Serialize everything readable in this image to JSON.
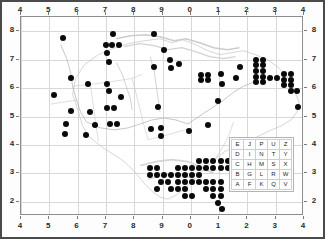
{
  "figure": {
    "type": "distribution-map",
    "background_color": "#ffffff",
    "frame_color": "#4a4a4a",
    "dot_color": "#0a0a0a",
    "gridline_color": "#d8d8d8",
    "coastline_color": "#b9b9b9"
  },
  "axes": {
    "top_labels": [
      "4",
      "5",
      "6",
      "7",
      "8",
      "9",
      "0",
      "1",
      "2",
      "3",
      "4"
    ],
    "bottom_labels": [
      "4",
      "5",
      "6",
      "7",
      "8",
      "9",
      "0",
      "1",
      "2",
      "3",
      "4"
    ],
    "left_labels": [
      "8",
      "7",
      "6",
      "5",
      "4",
      "3",
      "2"
    ],
    "right_labels": [
      "8",
      "7",
      "6",
      "5",
      "4",
      "3",
      "2"
    ]
  },
  "grid_key": {
    "rows": [
      [
        "E",
        "J",
        "P",
        "U",
        "Z"
      ],
      [
        "D",
        "I",
        "N",
        "T",
        "Y"
      ],
      [
        "C",
        "H",
        "M",
        "S",
        "X"
      ],
      [
        "B",
        "G",
        "L",
        "R",
        "W"
      ],
      [
        "A",
        "F",
        "K",
        "Q",
        "V"
      ]
    ]
  },
  "chart_data": {
    "type": "scatter",
    "title": "",
    "xlabel": "",
    "ylabel": "",
    "xlim": [
      4,
      14
    ],
    "ylim": [
      1.5,
      8.5
    ],
    "grid": true,
    "legend": "none",
    "x_tick_labels": [
      "4",
      "5",
      "6",
      "7",
      "8",
      "9",
      "0",
      "1",
      "2",
      "3",
      "4"
    ],
    "y_tick_labels": [
      "8",
      "7",
      "6",
      "5",
      "4",
      "3",
      "2"
    ],
    "marker": "filled-circle",
    "marker_size_px": 6,
    "point_count": 152,
    "points": [
      [
        5.5,
        7.75
      ],
      [
        7.25,
        7.9
      ],
      [
        8.7,
        7.9
      ],
      [
        7.0,
        7.5
      ],
      [
        7.2,
        7.5
      ],
      [
        7.45,
        7.5
      ],
      [
        7.05,
        7.25
      ],
      [
        9.05,
        7.35
      ],
      [
        9.25,
        7.0
      ],
      [
        9.6,
        6.85
      ],
      [
        10.35,
        6.45
      ],
      [
        10.6,
        6.45
      ],
      [
        10.35,
        6.3
      ],
      [
        10.6,
        6.3
      ],
      [
        11.05,
        6.5
      ],
      [
        11.75,
        6.75
      ],
      [
        12.3,
        7.0
      ],
      [
        12.55,
        7.0
      ],
      [
        12.3,
        6.8
      ],
      [
        12.55,
        6.8
      ],
      [
        12.3,
        6.6
      ],
      [
        12.55,
        6.6
      ],
      [
        12.3,
        6.4
      ],
      [
        12.55,
        6.4
      ],
      [
        12.3,
        6.2
      ],
      [
        12.55,
        6.2
      ],
      [
        12.8,
        6.35
      ],
      [
        13.05,
        6.35
      ],
      [
        13.3,
        6.5
      ],
      [
        13.55,
        6.5
      ],
      [
        13.3,
        6.3
      ],
      [
        13.55,
        6.3
      ],
      [
        13.3,
        6.1
      ],
      [
        13.55,
        6.1
      ],
      [
        13.55,
        5.9
      ],
      [
        13.75,
        5.9
      ],
      [
        13.8,
        5.35
      ],
      [
        7.1,
        6.9
      ],
      [
        8.7,
        6.75
      ],
      [
        9.3,
        6.7
      ],
      [
        5.75,
        6.35
      ],
      [
        6.35,
        6.15
      ],
      [
        7.05,
        6.15
      ],
      [
        5.15,
        5.75
      ],
      [
        7.1,
        5.9
      ],
      [
        7.55,
        5.7
      ],
      [
        11.1,
        6.15
      ],
      [
        11.6,
        6.35
      ],
      [
        10.95,
        5.55
      ],
      [
        8.85,
        5.35
      ],
      [
        5.75,
        5.2
      ],
      [
        5.6,
        4.75
      ],
      [
        5.55,
        4.4
      ],
      [
        6.45,
        5.15
      ],
      [
        7.05,
        5.3
      ],
      [
        7.3,
        5.3
      ],
      [
        6.6,
        4.7
      ],
      [
        7.15,
        4.75
      ],
      [
        7.4,
        4.75
      ],
      [
        6.3,
        4.35
      ],
      [
        8.6,
        4.55
      ],
      [
        8.95,
        4.6
      ],
      [
        8.95,
        4.3
      ],
      [
        9.95,
        4.5
      ],
      [
        10.6,
        4.7
      ],
      [
        12.35,
        4.05
      ],
      [
        12.9,
        3.8
      ],
      [
        8.55,
        3.2
      ],
      [
        8.8,
        3.2
      ],
      [
        8.55,
        2.95
      ],
      [
        8.8,
        2.95
      ],
      [
        9.05,
        2.95
      ],
      [
        9.3,
        2.95
      ],
      [
        8.95,
        2.7
      ],
      [
        9.2,
        2.7
      ],
      [
        8.8,
        2.45
      ],
      [
        9.55,
        3.2
      ],
      [
        9.8,
        3.2
      ],
      [
        10.05,
        3.2
      ],
      [
        9.55,
        2.95
      ],
      [
        9.8,
        2.95
      ],
      [
        10.05,
        2.95
      ],
      [
        10.3,
        2.95
      ],
      [
        9.55,
        2.7
      ],
      [
        9.8,
        2.7
      ],
      [
        10.05,
        2.7
      ],
      [
        9.3,
        2.45
      ],
      [
        9.55,
        2.45
      ],
      [
        9.8,
        2.45
      ],
      [
        9.8,
        2.2
      ],
      [
        10.05,
        2.2
      ],
      [
        10.3,
        3.45
      ],
      [
        10.55,
        3.45
      ],
      [
        10.8,
        3.45
      ],
      [
        11.05,
        3.45
      ],
      [
        11.3,
        3.45
      ],
      [
        11.55,
        3.45
      ],
      [
        10.3,
        3.2
      ],
      [
        10.55,
        3.2
      ],
      [
        10.8,
        3.2
      ],
      [
        11.05,
        3.2
      ],
      [
        11.3,
        3.2
      ],
      [
        11.55,
        3.2
      ],
      [
        11.8,
        3.55
      ],
      [
        10.3,
        2.7
      ],
      [
        10.55,
        2.7
      ],
      [
        10.8,
        2.7
      ],
      [
        11.05,
        2.7
      ],
      [
        10.55,
        2.45
      ],
      [
        10.8,
        2.45
      ],
      [
        11.05,
        2.45
      ],
      [
        10.8,
        2.2
      ],
      [
        11.05,
        2.2
      ],
      [
        10.95,
        1.95
      ],
      [
        11.1,
        1.75
      ]
    ]
  }
}
